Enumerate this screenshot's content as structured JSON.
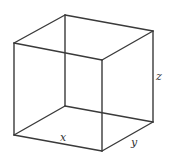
{
  "diagram": {
    "type": "wireframe-cube",
    "stroke_color": "#3a3a3a",
    "vertices": {
      "ftl": [
        14,
        43
      ],
      "ftr": [
        102,
        60
      ],
      "fbl": [
        14,
        135
      ],
      "fbr": [
        102,
        151
      ],
      "btl": [
        65,
        15
      ],
      "btr": [
        153,
        31
      ],
      "bbl": [
        65,
        106
      ],
      "bbr": [
        153,
        122
      ]
    },
    "labels": {
      "x": "x",
      "y": "y",
      "z": "z"
    }
  }
}
